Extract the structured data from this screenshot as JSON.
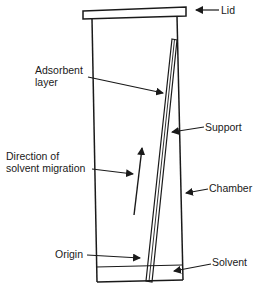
{
  "diagram": {
    "type": "chromatography-tank",
    "labels": {
      "lid": "Lid",
      "adsorbent_line1": "Adsorbent",
      "adsorbent_line2": "layer",
      "support": "Support",
      "direction_line1": "Direction of",
      "direction_line2": "solvent migration",
      "chamber": "Chamber",
      "origin": "Origin",
      "solvent": "Solvent"
    },
    "colors": {
      "stroke": "#1a1a1a",
      "background": "#ffffff"
    }
  }
}
